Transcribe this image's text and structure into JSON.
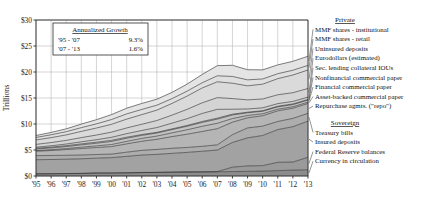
{
  "chart_data": {
    "type": "area",
    "title": "",
    "xlabel": "",
    "ylabel": "Trillions",
    "ylim": [
      0,
      30
    ],
    "ytick_values": [
      0,
      5,
      10,
      15,
      20,
      25,
      30
    ],
    "ytick_labels": [
      "$0",
      "$5",
      "$10",
      "$15",
      "$20",
      "$25",
      "$30"
    ],
    "grid": true,
    "stacked": true,
    "legend_position": "right",
    "x": [
      1995,
      1996,
      1997,
      1998,
      1999,
      2000,
      2001,
      2002,
      2003,
      2004,
      2005,
      2006,
      2007,
      2008,
      2009,
      2010,
      2011,
      2012,
      2013
    ],
    "categories": [
      "'95",
      "'96",
      "'97",
      "'98",
      "'99",
      "'00",
      "'01",
      "'02",
      "'03",
      "'04",
      "'05",
      "'06",
      "'07",
      "'08",
      "'09",
      "'10",
      "'11",
      "'12",
      "'13"
    ],
    "series": [
      {
        "name": "Currency in circulation",
        "group": "Sovereign",
        "color": "#8c8c8c",
        "values": [
          0.4,
          0.42,
          0.45,
          0.48,
          0.55,
          0.55,
          0.6,
          0.65,
          0.68,
          0.72,
          0.76,
          0.78,
          0.81,
          0.85,
          0.89,
          0.94,
          1.03,
          1.13,
          1.2
        ]
      },
      {
        "name": "Federal Reserve balances",
        "group": "Sovereign",
        "color": "#9a9a9a",
        "values": [
          0.03,
          0.03,
          0.03,
          0.03,
          0.03,
          0.03,
          0.03,
          0.03,
          0.03,
          0.03,
          0.03,
          0.03,
          0.03,
          0.85,
          1.05,
          1.05,
          1.6,
          1.55,
          2.4
        ]
      },
      {
        "name": "Insured deposits",
        "group": "Sovereign",
        "color": "#a2a2a2",
        "values": [
          2.7,
          2.72,
          2.75,
          2.8,
          2.85,
          2.95,
          3.15,
          3.35,
          3.45,
          3.6,
          3.75,
          3.95,
          4.15,
          4.75,
          5.4,
          5.8,
          6.3,
          6.8,
          6.95
        ]
      },
      {
        "name": "Treasury bills",
        "group": "Sovereign",
        "color": "#adadad",
        "values": [
          0.78,
          0.78,
          0.75,
          0.72,
          0.7,
          0.68,
          0.8,
          0.9,
          0.95,
          0.98,
          0.95,
          0.95,
          1.0,
          1.5,
          1.9,
          1.8,
          1.55,
          1.6,
          1.5
        ]
      },
      {
        "name": "Repurchase agmts. (\"repo\")",
        "group": "Private",
        "color": "#b5b5b5",
        "values": [
          0.85,
          0.95,
          1.1,
          1.25,
          1.35,
          1.45,
          1.6,
          1.75,
          1.95,
          2.25,
          2.55,
          2.85,
          3.1,
          2.4,
          1.95,
          2.0,
          2.05,
          1.95,
          1.9
        ]
      },
      {
        "name": "Asset-backed commercial paper",
        "group": "Private",
        "color": "#bcbcbc",
        "values": [
          0.12,
          0.16,
          0.2,
          0.26,
          0.32,
          0.4,
          0.48,
          0.55,
          0.62,
          0.72,
          0.85,
          1.0,
          1.05,
          0.7,
          0.45,
          0.38,
          0.32,
          0.28,
          0.25
        ]
      },
      {
        "name": "Financial commercial paper",
        "group": "Private",
        "color": "#c3c3c3",
        "values": [
          0.3,
          0.34,
          0.38,
          0.45,
          0.5,
          0.58,
          0.6,
          0.58,
          0.58,
          0.62,
          0.68,
          0.75,
          0.8,
          0.68,
          0.52,
          0.48,
          0.45,
          0.42,
          0.4
        ]
      },
      {
        "name": "Nonfinancial commercial paper",
        "group": "Private",
        "color": "#c9c9c9",
        "values": [
          0.15,
          0.16,
          0.17,
          0.19,
          0.2,
          0.22,
          0.2,
          0.16,
          0.14,
          0.14,
          0.15,
          0.17,
          0.18,
          0.16,
          0.11,
          0.11,
          0.12,
          0.13,
          0.13
        ]
      },
      {
        "name": "Sec. lending collateral IOUs",
        "group": "Private",
        "color": "#cfcfcf",
        "values": [
          0.2,
          0.25,
          0.32,
          0.4,
          0.48,
          0.58,
          0.68,
          0.78,
          0.92,
          1.1,
          1.3,
          1.55,
          1.7,
          0.95,
          0.62,
          0.55,
          0.5,
          0.48,
          0.45
        ]
      },
      {
        "name": "Eurodollars (estimated)",
        "group": "Private",
        "color": "#d4d4d4",
        "values": [
          0.55,
          0.62,
          0.7,
          0.8,
          0.9,
          1.0,
          1.1,
          1.2,
          1.35,
          1.55,
          1.8,
          2.05,
          2.25,
          2.05,
          1.75,
          1.7,
          1.7,
          1.68,
          1.65
        ]
      },
      {
        "name": "Uninsured deposits",
        "group": "Private",
        "color": "#dadada",
        "values": [
          0.85,
          0.95,
          1.05,
          1.2,
          1.35,
          1.5,
          1.7,
          1.85,
          2.0,
          2.25,
          2.55,
          2.85,
          3.05,
          2.95,
          2.7,
          2.85,
          3.1,
          3.4,
          3.55
        ]
      },
      {
        "name": "MMF shares - retail",
        "group": "Private",
        "color": "#dfdfdf",
        "values": [
          0.48,
          0.55,
          0.62,
          0.72,
          0.8,
          0.92,
          1.0,
          1.0,
          0.95,
          0.92,
          0.95,
          1.0,
          1.15,
          1.3,
          1.15,
          1.0,
          0.95,
          0.92,
          0.9
        ]
      },
      {
        "name": "MMF shares - institutional",
        "group": "Private",
        "color": "#e4e4e4",
        "values": [
          0.38,
          0.45,
          0.55,
          0.68,
          0.8,
          0.95,
          1.1,
          1.15,
          1.15,
          1.2,
          1.35,
          1.6,
          1.95,
          2.15,
          1.95,
          1.75,
          1.7,
          1.72,
          1.75
        ]
      }
    ],
    "totals_note": "Stacked total rises from about $7T in 1995 to about $26T in 2007, dips, then reaches about $27T in 2013"
  },
  "annotation": {
    "title": "Annualized Growth",
    "rows": [
      {
        "period": "'95 - '07",
        "value": "9.3%"
      },
      {
        "period": "'07 - '13",
        "value": "1.6%"
      }
    ]
  },
  "legend": {
    "groups": [
      {
        "heading": "Private",
        "items": [
          "MMF shares - institutional",
          "MMF shares - retail",
          "Uninsured deposits",
          "Eurodollars (estimated)",
          "Sec. lending collateral IOUs",
          "Nonfinancial commercial paper",
          "Financial commercial paper",
          "Asset-backed commercial paper",
          "Repurchase agmts. (\"repo\")"
        ]
      },
      {
        "heading": "Sovereign",
        "items": [
          "Treasury bills",
          "Insured deposits",
          "Federal Reserve balances",
          "Currency in circulation"
        ]
      }
    ]
  }
}
